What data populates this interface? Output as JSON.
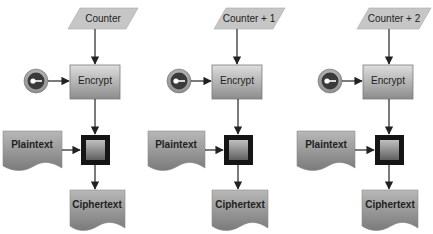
{
  "diagram": {
    "columns": [
      {
        "counter_label": "Counter",
        "encrypt_label": "Encrypt",
        "plaintext_label": "Plaintext",
        "ciphertext_label": "Ciphertext",
        "key_icon": "key-icon",
        "xor_icon": "xor-block"
      },
      {
        "counter_label": "Counter + 1",
        "encrypt_label": "Encrypt",
        "plaintext_label": "Plaintext",
        "ciphertext_label": "Ciphertext",
        "key_icon": "key-icon",
        "xor_icon": "xor-block"
      },
      {
        "counter_label": "Counter + 2",
        "encrypt_label": "Encrypt",
        "plaintext_label": "Plaintext",
        "ciphertext_label": "Ciphertext",
        "key_icon": "key-icon",
        "xor_icon": "xor-block"
      }
    ],
    "colors": {
      "shape_fill_top": "#dcdcdc",
      "shape_fill_bottom": "#8a8a8a",
      "counter_fill": "#c8c8c8",
      "xor_border": "#151515",
      "arrow": "#222222",
      "key_ring": "#9a9a9a",
      "key_core": "#3a3a3a"
    }
  }
}
